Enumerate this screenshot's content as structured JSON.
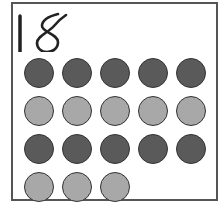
{
  "card": {
    "number": "18",
    "rows": [
      {
        "shade": "dark",
        "count": 5
      },
      {
        "shade": "light",
        "count": 5
      },
      {
        "shade": "dark",
        "count": 5
      },
      {
        "shade": "light",
        "count": 3
      }
    ],
    "total_dots": 18
  },
  "colors": {
    "dark_dot": "#5a5a5a",
    "light_dot": "#a8a8a8",
    "outline": "#333333",
    "frame": "#555555"
  }
}
